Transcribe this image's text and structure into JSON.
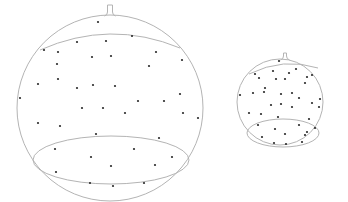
{
  "colors": {
    "outline": "#b4b4b4",
    "dot": "#2a2a2a",
    "background": "#ffffff"
  },
  "spheres": [
    {
      "name": "large-sphere",
      "cx": 110,
      "cy": 108,
      "r": 93,
      "stem": {
        "x": 110,
        "top": 5,
        "width": 5
      },
      "upper_cap": {
        "left_x": 40,
        "left_y": 50,
        "right_x": 180,
        "right_y": 48,
        "peak_y": 34
      },
      "lower_cap": {
        "cx": 111,
        "cy": 160,
        "rx": 78,
        "ry": 24,
        "top_y": 136
      },
      "dots": [
        [
          98,
          22
        ],
        [
          132,
          36
        ],
        [
          77,
          42
        ],
        [
          106,
          41
        ],
        [
          44,
          50
        ],
        [
          58,
          52
        ],
        [
          156,
          52
        ],
        [
          182,
          60
        ],
        [
          57,
          64
        ],
        [
          92,
          57
        ],
        [
          111,
          56
        ],
        [
          149,
          66
        ],
        [
          58,
          79
        ],
        [
          38,
          84
        ],
        [
          77,
          88
        ],
        [
          93,
          85
        ],
        [
          115,
          86
        ],
        [
          20,
          98
        ],
        [
          138,
          101
        ],
        [
          164,
          101
        ],
        [
          180,
          94
        ],
        [
          82,
          108
        ],
        [
          103,
          108
        ],
        [
          125,
          113
        ],
        [
          183,
          113
        ],
        [
          198,
          118
        ],
        [
          38,
          123
        ],
        [
          60,
          126
        ],
        [
          96,
          134
        ],
        [
          159,
          138
        ],
        [
          55,
          149
        ],
        [
          134,
          149
        ],
        [
          91,
          157
        ],
        [
          172,
          157
        ],
        [
          111,
          166
        ],
        [
          155,
          165
        ],
        [
          56,
          172
        ],
        [
          90,
          183
        ],
        [
          113,
          186
        ],
        [
          144,
          183
        ]
      ]
    },
    {
      "name": "small-sphere",
      "cx": 280,
      "cy": 102,
      "r": 43,
      "stem": {
        "x": 285,
        "top": 53,
        "width": 3
      },
      "upper_cap": {
        "left_x": 249,
        "left_y": 74,
        "right_x": 318,
        "right_y": 68,
        "peak_y": 64
      },
      "lower_cap": {
        "cx": 283,
        "cy": 133,
        "rx": 36,
        "ry": 14,
        "top_y": 119
      },
      "dots": [
        [
          279,
          61
        ],
        [
          255,
          74
        ],
        [
          273,
          71
        ],
        [
          289,
          73
        ],
        [
          296,
          69
        ],
        [
          312,
          75
        ],
        [
          259,
          78
        ],
        [
          265,
          88
        ],
        [
          276,
          79
        ],
        [
          285,
          79
        ],
        [
          307,
          77
        ],
        [
          305,
          83
        ],
        [
          264,
          92
        ],
        [
          281,
          94
        ],
        [
          292,
          93
        ],
        [
          299,
          98
        ],
        [
          240,
          95
        ],
        [
          253,
          93
        ],
        [
          271,
          105
        ],
        [
          281,
          104
        ],
        [
          292,
          107
        ],
        [
          312,
          103
        ],
        [
          320,
          99
        ],
        [
          319,
          107
        ],
        [
          249,
          113
        ],
        [
          261,
          114
        ],
        [
          278,
          117
        ],
        [
          309,
          119
        ],
        [
          258,
          125
        ],
        [
          275,
          129
        ],
        [
          285,
          134
        ],
        [
          299,
          125
        ],
        [
          307,
          132
        ],
        [
          315,
          128
        ],
        [
          262,
          137
        ],
        [
          305,
          135
        ],
        [
          274,
          143
        ],
        [
          286,
          144
        ],
        [
          302,
          142
        ]
      ]
    }
  ]
}
